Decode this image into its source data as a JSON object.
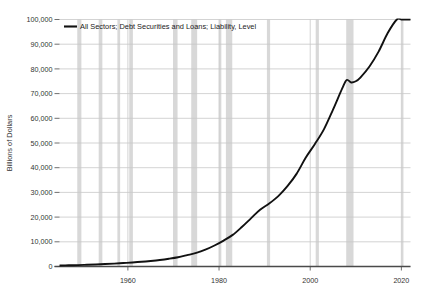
{
  "chart_data": {
    "type": "line",
    "title": "",
    "subtitle": "",
    "xlabel": "",
    "ylabel": "Billions of Dollars",
    "legend": [
      {
        "name": "All Sectors; Debt Securities and Loans; Liability, Level",
        "color": "#111111",
        "position": "top-left-inside"
      }
    ],
    "grid": true,
    "xlim": [
      1945,
      2022
    ],
    "ylim": [
      0,
      100000
    ],
    "yticks": [
      0,
      10000,
      20000,
      30000,
      40000,
      50000,
      60000,
      70000,
      80000,
      90000,
      100000
    ],
    "ytick_labels": [
      "0",
      "10,000",
      "20,000",
      "30,000",
      "40,000",
      "50,000",
      "60,000",
      "70,000",
      "80,000",
      "90,000",
      "100,000"
    ],
    "xticks": [
      1960,
      1980,
      2000,
      2020
    ],
    "xtick_labels": [
      "1960",
      "1980",
      "2000",
      "2020"
    ],
    "series": [
      {
        "name": "All Sectors; Debt Securities and Loans; Liability, Level",
        "color": "#111111",
        "x": [
          1945,
          1947,
          1949,
          1951,
          1953,
          1955,
          1957,
          1959,
          1961,
          1963,
          1965,
          1967,
          1969,
          1971,
          1973,
          1975,
          1977,
          1979,
          1981,
          1983,
          1985,
          1987,
          1989,
          1991,
          1993,
          1995,
          1997,
          1999,
          2001,
          2003,
          2005,
          2007,
          2008,
          2009,
          2010,
          2011,
          2013,
          2015,
          2017,
          2019,
          2020,
          2021,
          2022
        ],
        "values": [
          400,
          480,
          560,
          700,
          840,
          1000,
          1180,
          1400,
          1620,
          1900,
          2250,
          2650,
          3150,
          3750,
          4600,
          5500,
          6800,
          8500,
          10500,
          12800,
          16000,
          19500,
          23000,
          25500,
          28500,
          32500,
          37500,
          44000,
          49500,
          55500,
          63500,
          72000,
          75500,
          74500,
          75000,
          76500,
          81000,
          87000,
          94500,
          101500,
          116000,
          124000,
          129000
        ]
      }
    ],
    "recession_bands": [
      {
        "start": 1948.9,
        "end": 1949.8
      },
      {
        "start": 1953.6,
        "end": 1954.4
      },
      {
        "start": 1957.7,
        "end": 1958.3
      },
      {
        "start": 1960.3,
        "end": 1961.1
      },
      {
        "start": 1969.9,
        "end": 1970.9
      },
      {
        "start": 1973.9,
        "end": 1975.2
      },
      {
        "start": 1980.0,
        "end": 1980.5
      },
      {
        "start": 1981.5,
        "end": 1982.9
      },
      {
        "start": 1990.5,
        "end": 1991.2
      },
      {
        "start": 2001.2,
        "end": 2001.9
      },
      {
        "start": 2007.9,
        "end": 2009.5
      },
      {
        "start": 2020.1,
        "end": 2020.4
      }
    ],
    "band_color": "#d8d8d8",
    "grid_color": "#c8c8c8",
    "axis_color": "#4a4a4a"
  },
  "legend_label": "All Sectors; Debt Securities and Loans; Liability, Level",
  "y_axis_title": "Billions of Dollars"
}
